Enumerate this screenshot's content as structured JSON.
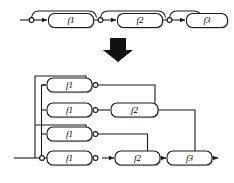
{
  "figure": {
    "kind": "block-diagram",
    "colors": {
      "line": "#1a1a1a",
      "block_fill": "#ffffff",
      "block_stroke": "#1a1a1a",
      "shadow": "#9a9a9a",
      "node_fill": "#ffffff",
      "arrow_fill": "#111111",
      "background": "#ffffff"
    }
  },
  "top_chain": {
    "name": "residual-chain",
    "blocks": [
      {
        "label": "f1"
      },
      {
        "label": "f2"
      },
      {
        "label": "f3"
      }
    ],
    "nodes": 4,
    "skip_arcs": 3,
    "input_arrow": "▶",
    "output_arrow": "▶"
  },
  "transform_arrow": {
    "name": "down-arrow",
    "glyph": "⬇"
  },
  "unrolled": {
    "name": "unrolled-paths",
    "paths": [
      {
        "index": 1,
        "blocks": [
          "f1"
        ]
      },
      {
        "index": 2,
        "blocks": [
          "f1",
          "f2"
        ]
      },
      {
        "index": 3,
        "blocks": [
          "f1"
        ]
      },
      {
        "index": 4,
        "blocks": [
          "f1",
          "f2",
          "f3"
        ]
      }
    ],
    "rows": [
      {
        "row": 1,
        "blocks": [
          {
            "label": "f1"
          }
        ]
      },
      {
        "row": 2,
        "blocks": [
          {
            "label": "f1"
          },
          {
            "label": "f2"
          }
        ]
      },
      {
        "row": 3,
        "blocks": [
          {
            "label": "f1"
          }
        ]
      },
      {
        "row": 4,
        "blocks": [
          {
            "label": "f1"
          },
          {
            "label": "f2"
          },
          {
            "label": "f3"
          }
        ]
      }
    ]
  }
}
